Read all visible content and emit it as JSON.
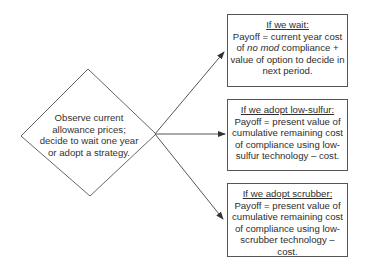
{
  "diagram": {
    "decision_node": {
      "shape": "diamond",
      "text": "Observe current allowance prices; decide to wait one year or adopt a strategy."
    },
    "outcomes": [
      {
        "title": "If we wait:",
        "body_pre": "Payoff = current year cost of ",
        "body_em": "no mod",
        "body_post": " compliance + value of option to decide in next period."
      },
      {
        "title": "If we adopt low-sulfur:",
        "body": "Payoff = present value of cumulative remaining cost of compliance using low-sulfur technology – cost."
      },
      {
        "title": "If we adopt scrubber:",
        "body": "Payoff = present value of cumulative remaining cost of compliance using low-scrubber technology – cost."
      }
    ],
    "colors": {
      "line": "#555555",
      "text": "#2e2e2e",
      "background": "#ffffff"
    }
  }
}
